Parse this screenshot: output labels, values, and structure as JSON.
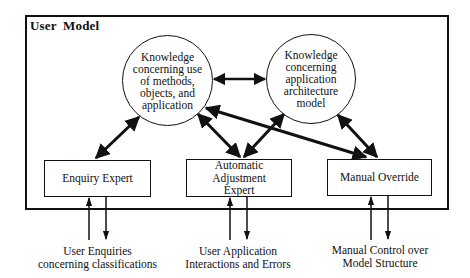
{
  "diagram": {
    "container": {
      "title": "User Model"
    },
    "nodes": {
      "knowledge_use": {
        "shape": "circle",
        "lines": [
          "Knowledge",
          "concerning use",
          "of methods,",
          "objects, and",
          "application"
        ]
      },
      "knowledge_arch": {
        "shape": "circle",
        "lines": [
          "Knowledge",
          "concerning",
          "application",
          "architecture",
          "model"
        ]
      },
      "enquiry_expert": {
        "shape": "box",
        "label": "Enquiry Expert"
      },
      "auto_adjust": {
        "shape": "box",
        "lines": [
          "Automatic Adjustment",
          "Expert"
        ]
      },
      "manual_override": {
        "shape": "box",
        "label": "Manual Override"
      }
    },
    "captions": {
      "enquiry": [
        "User Enquiries",
        "concerning classifications"
      ],
      "auto": [
        "User Application",
        "Interactions and Errors"
      ],
      "manual": [
        "Manual Control over",
        "Model Structure"
      ]
    },
    "edges": [
      {
        "from": "knowledge_use",
        "to": "knowledge_arch",
        "type": "bidirectional"
      },
      {
        "from": "knowledge_use",
        "to": "enquiry_expert",
        "type": "bidirectional"
      },
      {
        "from": "knowledge_use",
        "to": "auto_adjust",
        "type": "bidirectional"
      },
      {
        "from": "knowledge_use",
        "to": "manual_override",
        "type": "bidirectional"
      },
      {
        "from": "knowledge_arch",
        "to": "auto_adjust",
        "type": "bidirectional"
      },
      {
        "from": "knowledge_arch",
        "to": "manual_override",
        "type": "bidirectional"
      },
      {
        "from": "caption_enquiry",
        "to": "enquiry_expert",
        "type": "input"
      },
      {
        "from": "enquiry_expert",
        "to": "caption_enquiry",
        "type": "output"
      },
      {
        "from": "caption_auto",
        "to": "auto_adjust",
        "type": "input"
      },
      {
        "from": "auto_adjust",
        "to": "caption_auto",
        "type": "output"
      },
      {
        "from": "caption_manual",
        "to": "manual_override",
        "type": "input"
      },
      {
        "from": "manual_override",
        "to": "caption_manual",
        "type": "output"
      }
    ]
  }
}
